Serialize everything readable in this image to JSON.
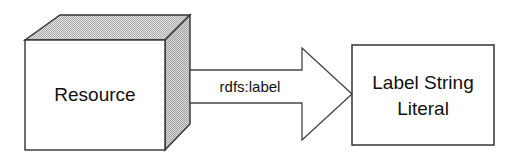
{
  "diagram": {
    "background_color": "#ffffff",
    "stroke_color": "#222222",
    "face_fill_light": "#c9c9c9",
    "face_fill_side": "#bdbdbd",
    "node_fill": "#ffffff",
    "nodes": [
      {
        "id": "resource",
        "shape": "3d-box",
        "label": "Resource",
        "label_lines": [
          "Resource"
        ]
      },
      {
        "id": "label-literal",
        "shape": "rectangle",
        "label": "Label String Literal",
        "label_lines": [
          "Label String",
          "Literal"
        ]
      }
    ],
    "edges": [
      {
        "id": "rdfs-label-edge",
        "from": "resource",
        "to": "label-literal",
        "label": "rdfs:label",
        "style": "open-block-arrow",
        "direction": "right"
      }
    ]
  }
}
